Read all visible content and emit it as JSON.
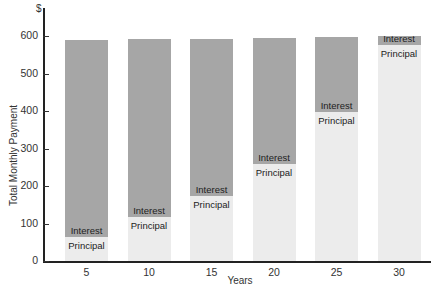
{
  "chart_data": {
    "type": "bar",
    "stacked": true,
    "title": "",
    "xlabel": "Years",
    "ylabel": "Total Monthly Payment",
    "yunit": "$",
    "ylim": [
      0,
      650
    ],
    "yticks": [
      0,
      100,
      200,
      300,
      400,
      500,
      600
    ],
    "categories": [
      "5",
      "10",
      "15",
      "20",
      "25",
      "30"
    ],
    "series": [
      {
        "name": "Principal",
        "color": "#ececec",
        "values": [
          65,
          118,
          173,
          258,
          397,
          576
        ]
      },
      {
        "name": "Interest",
        "color": "#a6a6a6",
        "values": [
          525,
          473,
          420,
          337,
          200,
          24
        ]
      }
    ],
    "totals": [
      590,
      591,
      593,
      595,
      597,
      600
    ],
    "grid": false,
    "legend": "inline segment labels"
  },
  "labels": {
    "dollar": "$",
    "ylabel": "Total Monthly Payment",
    "xlabel": "Years",
    "interest": "Interest",
    "principal": "Principal",
    "yticks": [
      "0",
      "100",
      "200",
      "300",
      "400",
      "500",
      "600"
    ],
    "categories": [
      "5",
      "10",
      "15",
      "20",
      "25",
      "30"
    ]
  }
}
